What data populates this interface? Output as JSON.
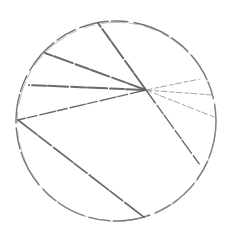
{
  "diagram": {
    "type": "hand-drawn circle sketch with radial lines and a chord",
    "stroke_color": "#5a5a5a",
    "light_stroke_color": "#9a9a9a",
    "circle": {
      "cx": 116,
      "cy": 121,
      "r": 100
    },
    "hub": {
      "x": 146,
      "y": 90
    },
    "radial_lines": [
      {
        "name": "line-to-top",
        "x": 98,
        "y": 23,
        "weight": "heavy"
      },
      {
        "name": "line-to-upper-left",
        "x": 45,
        "y": 53,
        "weight": "heavy"
      },
      {
        "name": "line-to-left",
        "x": 29,
        "y": 85,
        "weight": "heavy"
      },
      {
        "name": "line-to-far-left",
        "x": 18,
        "y": 120,
        "weight": "medium"
      },
      {
        "name": "line-to-upper-right",
        "x": 200,
        "y": 79,
        "weight": "light"
      },
      {
        "name": "line-to-right",
        "x": 212,
        "y": 95,
        "weight": "light"
      },
      {
        "name": "line-to-right-lower",
        "x": 214,
        "y": 117,
        "weight": "light"
      },
      {
        "name": "line-to-lower-right",
        "x": 200,
        "y": 165,
        "weight": "medium"
      }
    ],
    "chord": {
      "x1": 18,
      "y1": 120,
      "x2": 145,
      "y2": 218
    }
  }
}
